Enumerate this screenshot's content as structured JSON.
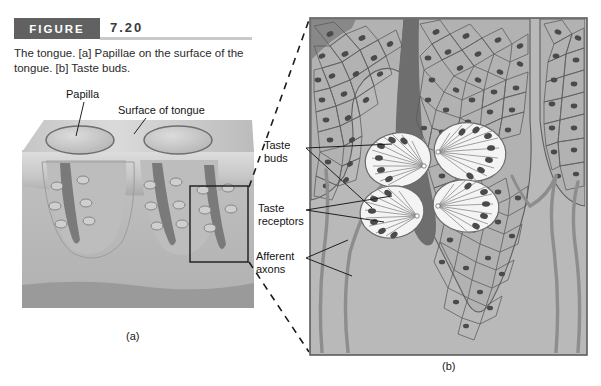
{
  "figure": {
    "badge": "FIGURE",
    "number": "7.20",
    "caption": "The tongue. [a] Papillae on the surface of the tongue. [b] Taste buds."
  },
  "panel_a": {
    "caption": "(a)",
    "labels": [
      {
        "id": "papilla",
        "text": "Papilla"
      },
      {
        "id": "surface-of-tongue",
        "text": "Surface of tongue"
      }
    ]
  },
  "panel_b": {
    "caption": "(b)",
    "labels": [
      {
        "id": "taste-buds",
        "line1": "Taste",
        "line2": "buds"
      },
      {
        "id": "taste-receptors",
        "line1": "Taste",
        "line2": "receptors"
      },
      {
        "id": "afferent-axons",
        "line1": "Afferent",
        "line2": "axons"
      }
    ]
  },
  "colors": {
    "badge_bg": "#616161",
    "badge_text": "#ffffff",
    "rule": "#c9c9c9",
    "panel_bg": "#b9b9b9",
    "panel_border": "#5d5d5d",
    "epithelium": "#b0b0b0",
    "epithelium_line": "#5a5a5a",
    "nucleus": "#4a4a4a",
    "trench_dark": "#6e6e6e",
    "taste_bud_fill": "#f2f2f2",
    "taste_bud_line": "#6a6a6a",
    "axon": "#8b8b8b",
    "muscle_band": "#9a9a9a",
    "tongue_surface": "#c3c3c3",
    "leader_line": "#2a2a2a",
    "dashed_connector": "#1c1c1c"
  }
}
